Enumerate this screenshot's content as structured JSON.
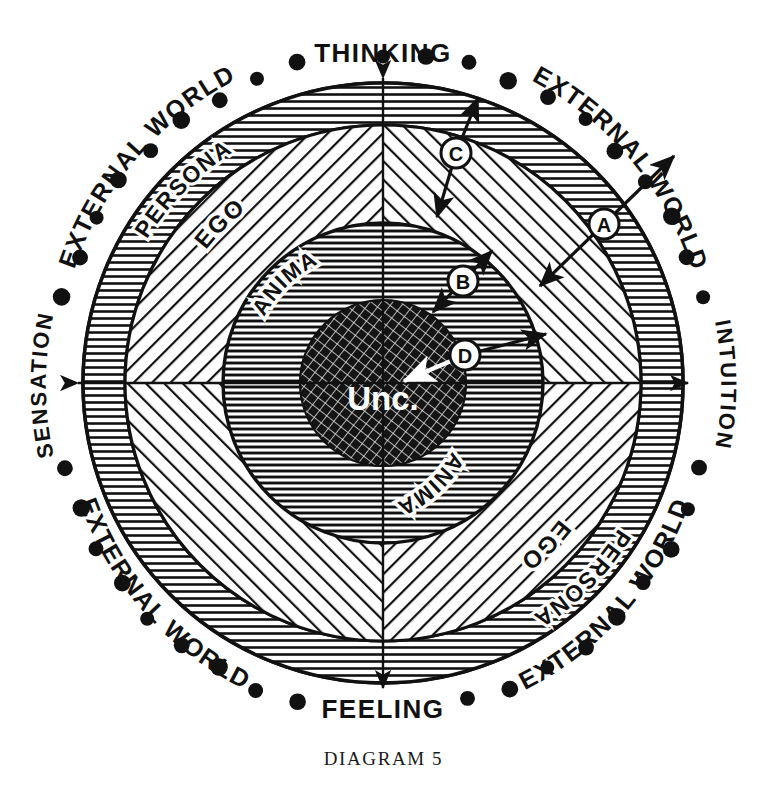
{
  "figure": {
    "caption": "DIAGRAM 5",
    "center_label": "Unc."
  },
  "axes": {
    "top": "THINKING",
    "bottom": "FEELING",
    "left": "SENSATION",
    "right": "INTUITION"
  },
  "outer_labels": [
    {
      "text": "EXTERNAL WORLD",
      "quadrant": "top-left"
    },
    {
      "text": "EXTERNAL WORLD",
      "quadrant": "top-right"
    },
    {
      "text": "EXTERNAL WORLD",
      "quadrant": "bottom-left"
    },
    {
      "text": "EXTERNAL WORLD",
      "quadrant": "bottom-right"
    }
  ],
  "rings": [
    {
      "name": "persona",
      "label": "PERSONA",
      "fill": "radial-ticks",
      "r_outer": 300,
      "r_inner": 258
    },
    {
      "name": "ego",
      "label": "EGO",
      "fill": "diagonal-hatch",
      "r_outer": 258,
      "r_inner": 160
    },
    {
      "name": "anima",
      "label": "ANIMA",
      "fill": "horizontal-hatch",
      "r_outer": 160,
      "r_inner": 83
    },
    {
      "name": "unconscious",
      "label": "Unc.",
      "fill": "cross-hatch",
      "r_outer": 83,
      "r_inner": 0
    }
  ],
  "ring_labels": [
    {
      "text": "PERSONA",
      "position": "upper-left"
    },
    {
      "text": "PERSONA",
      "position": "lower-right"
    },
    {
      "text": "EGO",
      "position": "upper-left"
    },
    {
      "text": "EGO",
      "position": "lower-right"
    },
    {
      "text": "ANIMA",
      "position": "upper-left"
    },
    {
      "text": "ANIMA",
      "position": "lower-right"
    }
  ],
  "markers": [
    {
      "id": "A",
      "label": "A",
      "x": 604,
      "y": 224,
      "note": "double-headed arrow crossing persona into external world"
    },
    {
      "id": "B",
      "label": "B",
      "x": 463,
      "y": 281,
      "note": "double-headed arrow crossing anima boundary"
    },
    {
      "id": "C",
      "label": "C",
      "x": 456,
      "y": 153,
      "note": "double-headed arrow crossing ego into persona"
    },
    {
      "id": "D",
      "label": "D",
      "x": 465,
      "y": 355,
      "note": "double-headed arrow from unconscious outward"
    }
  ],
  "colors": {
    "ink": "#111111",
    "paper": "#ffffff",
    "core_fill": "#1b1b1b"
  },
  "geometry": {
    "center_x": 383,
    "center_y": 383,
    "dot_ring_radius": 330,
    "dot_count": 48
  }
}
